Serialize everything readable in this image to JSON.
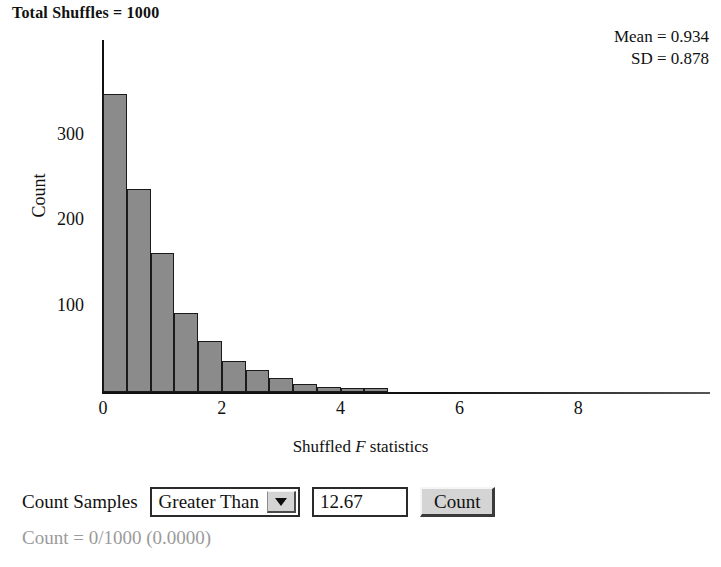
{
  "title": "Total Shuffles = 1000",
  "stats": {
    "mean_label": "Mean = 0.934",
    "sd_label": "SD = 0.878"
  },
  "chart_data": {
    "type": "bar",
    "title": "Total Shuffles = 1000",
    "xlabel": "Shuffled F statistics",
    "ylabel": "Count",
    "xlim": [
      0,
      9.2
    ],
    "ylim": [
      0,
      400
    ],
    "xticks": [
      0,
      2,
      4,
      6,
      8
    ],
    "yticks": [
      100,
      200,
      300
    ],
    "grid": false,
    "bin_width": 0.4,
    "bin_starts": [
      0.0,
      0.4,
      0.8,
      1.2,
      1.6,
      2.0,
      2.4,
      2.8,
      3.2,
      3.6,
      4.0,
      4.4
    ],
    "categories": [
      "0.0-0.4",
      "0.4-0.8",
      "0.8-1.2",
      "1.2-1.6",
      "1.6-2.0",
      "2.0-2.4",
      "2.4-2.8",
      "2.8-3.2",
      "3.2-3.6",
      "3.6-4.0",
      "4.0-4.4",
      "4.4-4.8"
    ],
    "values": [
      348,
      238,
      163,
      93,
      60,
      36,
      26,
      16,
      9,
      6,
      3,
      2
    ],
    "annotations": [
      "Mean = 0.934",
      "SD = 0.878"
    ],
    "bar_color": "#8b8b8b",
    "bar_edge_color": "#1a1a1a"
  },
  "controls": {
    "count_samples_label": "Count Samples",
    "comparison": {
      "selected": "Greater Than",
      "options": [
        "Greater Than",
        "Less Than"
      ],
      "arrow_icon": "chevron-down-icon"
    },
    "threshold_value": "12.67",
    "count_button_label": "Count"
  },
  "result_text": "Count = 0/1000 (0.0000)"
}
